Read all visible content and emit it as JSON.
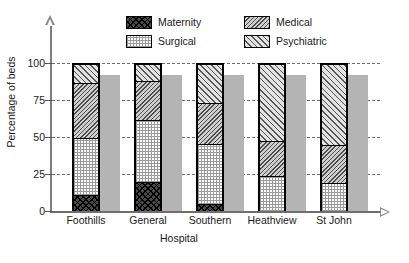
{
  "chart_data": {
    "type": "bar",
    "subtype": "stacked-percentage",
    "title": "",
    "xlabel": "Hospital",
    "ylabel": "Percentage of beds",
    "categories": [
      "Foothills",
      "General",
      "Southern",
      "Heathview",
      "St John"
    ],
    "yticks": [
      0,
      25,
      50,
      75,
      100
    ],
    "ylim": [
      0,
      100
    ],
    "grid": true,
    "legend_position": "top",
    "series": [
      {
        "name": "Maternity",
        "values": [
          11,
          20,
          5,
          0,
          0
        ]
      },
      {
        "name": "Surgical",
        "values": [
          39,
          42,
          41,
          24,
          19
        ]
      },
      {
        "name": "Medical",
        "values": [
          38,
          27,
          28,
          24,
          26
        ]
      },
      {
        "name": "Psychiatric",
        "values": [
          12,
          11,
          26,
          52,
          55
        ]
      }
    ],
    "cumulative_boundaries": {
      "Foothills": [
        11,
        50,
        88,
        100
      ],
      "General": [
        20,
        62,
        89,
        100
      ],
      "Southern": [
        5,
        46,
        74,
        100
      ],
      "Heathview": [
        0,
        24,
        48,
        100
      ],
      "St John": [
        0,
        19,
        45,
        100
      ]
    },
    "shadow_bar_height": 92
  },
  "legend": {
    "items": [
      {
        "label": "Maternity",
        "pattern": "dark-cross-hatch",
        "swatch_icon": "legend-swatch-icon"
      },
      {
        "label": "Medical",
        "pattern": "grey-diagonal-hatch",
        "swatch_icon": "legend-swatch-icon"
      },
      {
        "label": "Surgical",
        "pattern": "light-dots",
        "swatch_icon": "legend-swatch-icon"
      },
      {
        "label": "Psychiatric",
        "pattern": "light-diagonal-hatch",
        "swatch_icon": "legend-swatch-icon"
      }
    ]
  },
  "axes": {
    "y_title": "Percentage of beds",
    "x_title": "Hospital",
    "y_tick_labels": [
      "100",
      "75",
      "50",
      "25",
      "0"
    ],
    "x_tick_labels": [
      "Foothills",
      "General",
      "Southern",
      "Heathview",
      "St John"
    ]
  },
  "colors": {
    "maternity": "#4a4a4a",
    "surgical": "#ffffff",
    "medical": "#cfcfcf",
    "psychiatric": "#e2e2e2",
    "shadow": "#b4b4b4",
    "axis": "#7d7d7d",
    "grid": "#6c6c6c",
    "text": "#1a1a1a"
  },
  "caption": ""
}
